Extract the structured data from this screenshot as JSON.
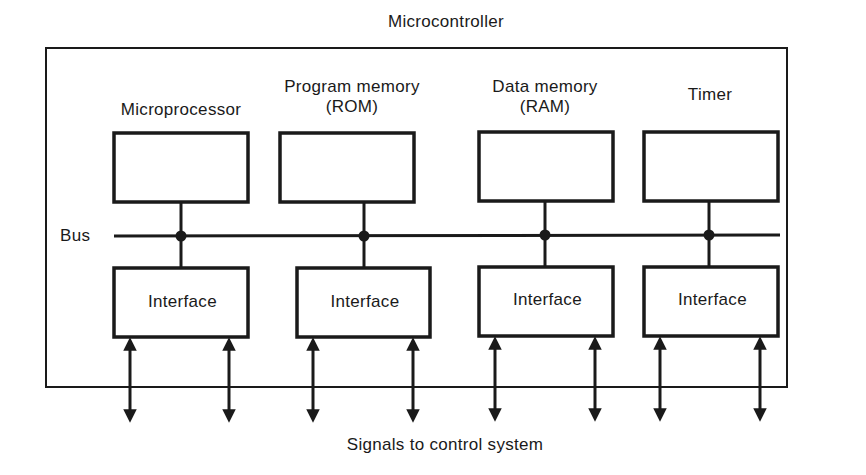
{
  "title": "Microcontroller",
  "bus_label": "Bus",
  "footer": "Signals to control system",
  "blocks": [
    {
      "name": "Microprocessor",
      "line1": "Microprocessor",
      "line2": ""
    },
    {
      "name": "Program memory (ROM)",
      "line1": "Program memory",
      "line2": "(ROM)"
    },
    {
      "name": "Data memory (RAM)",
      "line1": "Data memory",
      "line2": "(RAM)"
    },
    {
      "name": "Timer",
      "line1": "Timer",
      "line2": ""
    }
  ],
  "interfaces": [
    {
      "label": "Interface"
    },
    {
      "label": "Interface"
    },
    {
      "label": "Interface"
    },
    {
      "label": "Interface"
    }
  ],
  "colors": {
    "stroke": "#1a1a1a",
    "background": "#ffffff"
  }
}
